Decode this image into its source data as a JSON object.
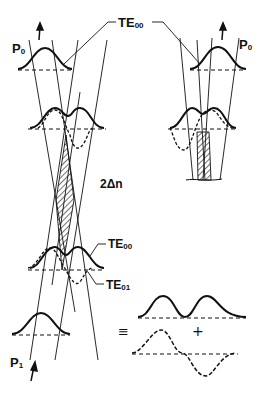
{
  "diagram": {
    "labels": {
      "p0_left": {
        "main": "P",
        "sub": "0"
      },
      "p0_right": {
        "main": "P",
        "sub": "0"
      },
      "p1": {
        "main": "P",
        "sub": "1"
      },
      "te00_top": {
        "main": "TE",
        "sub": "00"
      },
      "te00_mid": {
        "main": "TE",
        "sub": "00"
      },
      "te01": {
        "main": "TE",
        "sub": "01"
      },
      "delta_n": "2Δn",
      "equiv": "≡",
      "plus": "+"
    },
    "colors": {
      "ink": "#111111",
      "background": "#ffffff"
    }
  }
}
